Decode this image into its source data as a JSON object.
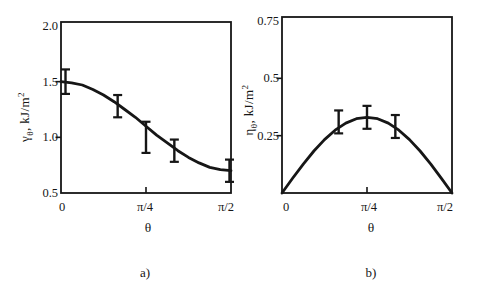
{
  "style": {
    "background": "#ffffff",
    "ink": "#161616"
  },
  "chart_data": [
    {
      "panel": "a)",
      "type": "line",
      "xlabel": "θ",
      "ylabel": "γθ, kJ/m²",
      "ylabel_parts": {
        "symbol": "γ",
        "symbol_sub": "θ",
        "units": ", kJ/m",
        "units_sup": "2"
      },
      "xticks": [
        {
          "t": 0,
          "label": "0"
        },
        {
          "t": 0.5,
          "label": "π/4"
        },
        {
          "t": 1,
          "label": "π/2"
        }
      ],
      "yticks": [
        {
          "value": 2.0,
          "label": "2.0"
        },
        {
          "value": 1.5,
          "label": "1.5"
        },
        {
          "value": 1.0,
          "label": "1.0"
        },
        {
          "value": 0.5,
          "label": "0.5"
        }
      ],
      "ylim": [
        0.5,
        2.0
      ],
      "xlim": [
        "0",
        "π/2"
      ],
      "grid": false,
      "curve": {
        "t": [
          0,
          0.0625,
          0.125,
          0.1875,
          0.25,
          0.3125,
          0.375,
          0.4375,
          0.5,
          0.5625,
          0.625,
          0.6875,
          0.75,
          0.8125,
          0.875,
          0.9375,
          1
        ],
        "y": [
          1.5,
          1.49,
          1.47,
          1.43,
          1.38,
          1.32,
          1.25,
          1.18,
          1.1,
          1.02,
          0.95,
          0.88,
          0.82,
          0.77,
          0.73,
          0.71,
          0.7
        ]
      },
      "points": [
        {
          "theta": "0",
          "t": 0,
          "y": 1.5,
          "err": 0.11
        },
        {
          "theta": "π/6",
          "t": 0.3333,
          "y": 1.28,
          "err": 0.1
        },
        {
          "theta": "π/4",
          "t": 0.5,
          "y": 1.0,
          "err": 0.14
        },
        {
          "theta": "π/3",
          "t": 0.6667,
          "y": 0.88,
          "err": 0.1
        },
        {
          "theta": "π/2",
          "t": 1,
          "y": 0.7,
          "err": 0.1
        }
      ]
    },
    {
      "panel": "b)",
      "type": "line",
      "xlabel": "θ",
      "ylabel": "ηθ, kJ/m²",
      "ylabel_parts": {
        "symbol": "η",
        "symbol_sub": "θ",
        "units": ", kJ/m",
        "units_sup": "2"
      },
      "xticks": [
        {
          "t": 0,
          "label": "0"
        },
        {
          "t": 0.5,
          "label": "π/4"
        },
        {
          "t": 1,
          "label": "π/2"
        }
      ],
      "yticks": [
        {
          "value": 0.75,
          "label": "0.75"
        },
        {
          "value": 0.5,
          "label": "0.5"
        },
        {
          "value": 0.25,
          "label": "0.25"
        }
      ],
      "ylim": [
        0,
        0.75
      ],
      "xlim": [
        "0",
        "π/2"
      ],
      "grid": false,
      "curve": {
        "t": [
          0,
          0.0625,
          0.125,
          0.1875,
          0.25,
          0.3125,
          0.375,
          0.4375,
          0.5,
          0.5625,
          0.625,
          0.6875,
          0.75,
          0.8125,
          0.875,
          0.9375,
          1
        ],
        "y": [
          0,
          0.064,
          0.126,
          0.183,
          0.233,
          0.274,
          0.305,
          0.324,
          0.33,
          0.324,
          0.305,
          0.274,
          0.233,
          0.183,
          0.126,
          0.064,
          0
        ]
      },
      "points": [
        {
          "theta": "π/6",
          "t": 0.3333,
          "y": 0.31,
          "err": 0.05
        },
        {
          "theta": "π/4",
          "t": 0.5,
          "y": 0.33,
          "err": 0.05
        },
        {
          "theta": "π/3",
          "t": 0.6667,
          "y": 0.29,
          "err": 0.05
        }
      ]
    }
  ]
}
